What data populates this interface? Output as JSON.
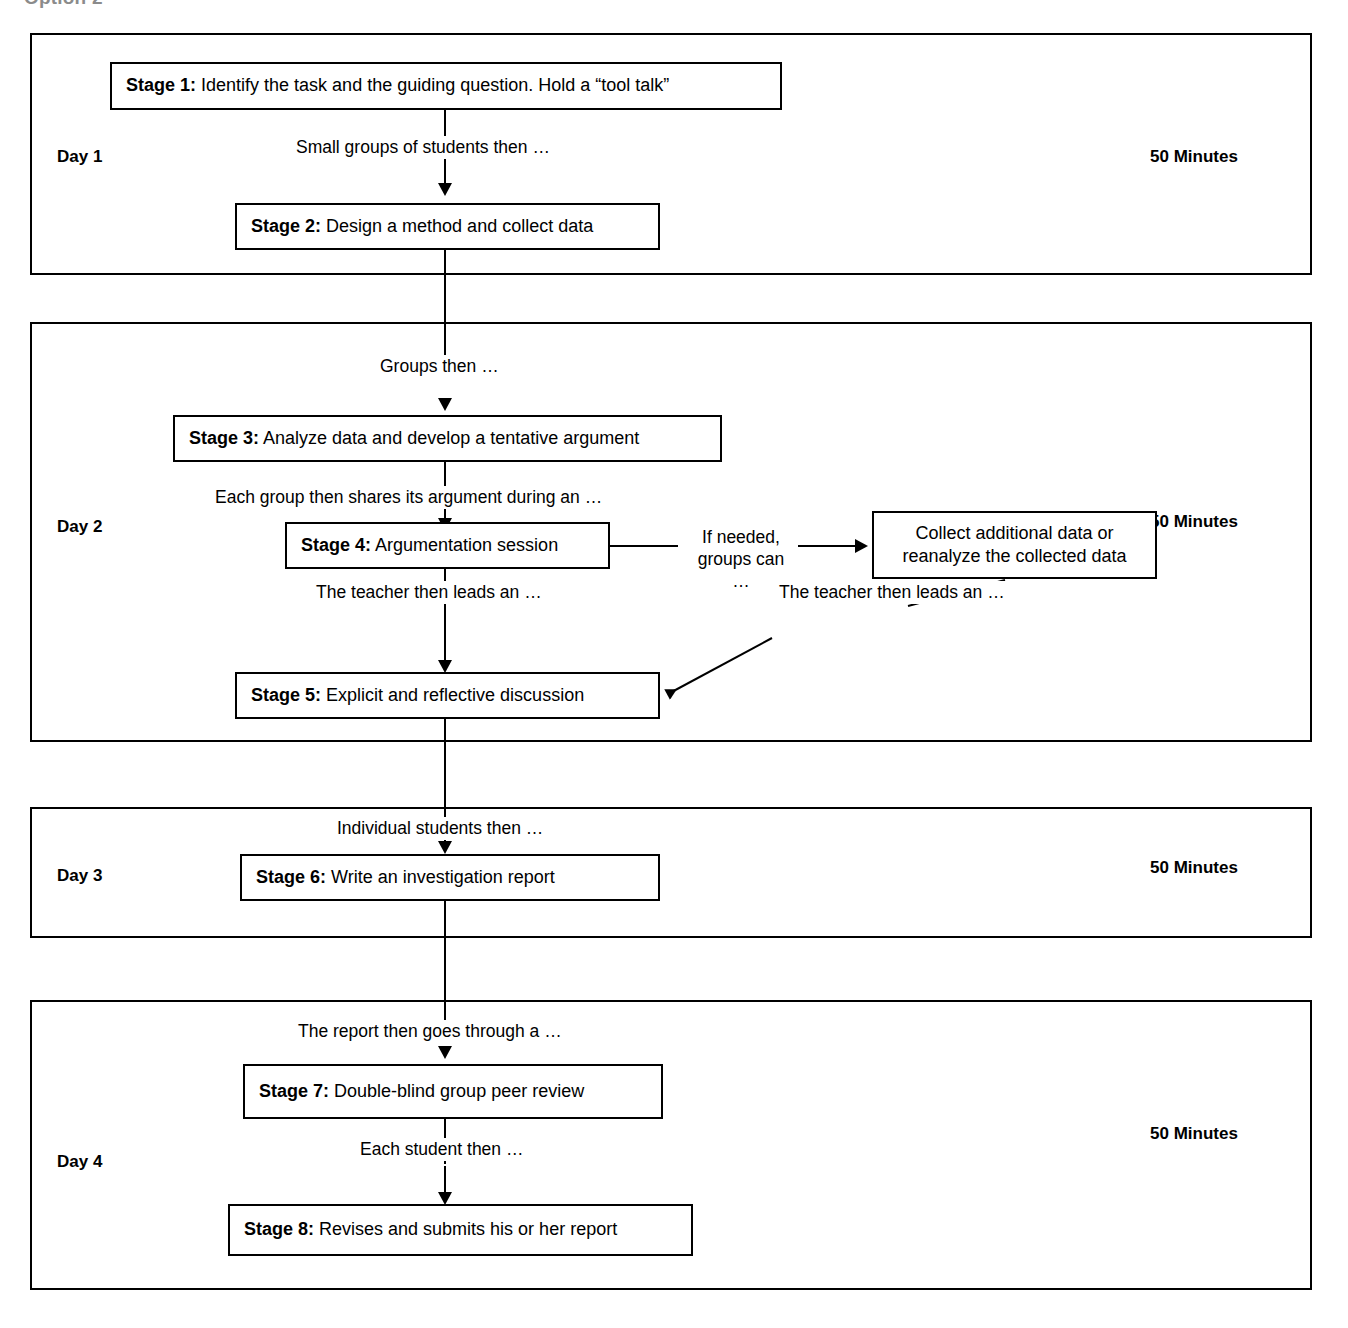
{
  "heading": {
    "text": "Option 2",
    "note": "cropped at top edge"
  },
  "minutes_label": "50 Minutes",
  "days": [
    {
      "id": "day-1",
      "label": "Day 1",
      "minutes": "50 Minutes"
    },
    {
      "id": "day-2",
      "label": "Day 2",
      "minutes": "50 Minutes"
    },
    {
      "id": "day-3",
      "label": "Day 3",
      "minutes": "50 Minutes"
    },
    {
      "id": "day-4",
      "label": "Day 4",
      "minutes": "50 Minutes"
    }
  ],
  "stages": [
    {
      "key": "Stage 1:",
      "text": " Identify the task and the guiding question. Hold a “tool talk”"
    },
    {
      "key": "Stage 2:",
      "text": " Design a method and collect data"
    },
    {
      "key": "Stage 3:",
      "text": " Analyze data and develop a tentative argument"
    },
    {
      "key": "Stage 4:",
      "text": " Argumentation session"
    },
    {
      "key": "Stage 5:",
      "text": " Explicit and reflective discussion"
    },
    {
      "key": "Stage 6:",
      "text": " Write an investigation report"
    },
    {
      "key": "Stage 7:",
      "text": " Double-blind group peer review"
    },
    {
      "key": "Stage 8:",
      "text": " Revises and submits his or her report"
    }
  ],
  "side_box": {
    "line1": "Collect additional data or",
    "line2": "reanalyze the collected data"
  },
  "connectors": [
    {
      "id": "c1",
      "text": "Small groups of students then …"
    },
    {
      "id": "c2",
      "text": "Groups then …"
    },
    {
      "id": "c3",
      "text": "Each group then shares its argument during an …"
    },
    {
      "id": "c4_line1",
      "text": "If needed,"
    },
    {
      "id": "c4_line2",
      "text": "groups can …"
    },
    {
      "id": "c5",
      "text": "The teacher then leads an …"
    },
    {
      "id": "c6",
      "text": "The teacher then leads an …"
    },
    {
      "id": "c7",
      "text": "Individual students then …"
    },
    {
      "id": "c8",
      "text": "The report then goes through a …"
    },
    {
      "id": "c9",
      "text": "Each student then …"
    }
  ],
  "colors": {
    "line": "#000000",
    "background": "#ffffff",
    "text": "#000000"
  }
}
